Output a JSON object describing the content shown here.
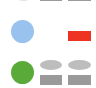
{
  "colors": {
    "background": "#ffffff",
    "blue": "#99c2ee",
    "red": "#ee3322",
    "green": "#5aaa3a",
    "gray_ellipse": "#bdbdbd",
    "gray_rect": "#9a9a9a",
    "faint_top": "#e6e6e6"
  },
  "rows": [
    {
      "name": "top-partial-row",
      "shapes": [
        {
          "type": "circle-partial",
          "color": "faint_top"
        },
        {
          "type": "rect-partial",
          "color": "gray_rect"
        },
        {
          "type": "rect-partial",
          "color": "gray_rect"
        }
      ]
    },
    {
      "name": "blue-row",
      "shapes": [
        {
          "type": "circle",
          "color": "blue"
        },
        {
          "type": "rect",
          "color": "red"
        }
      ]
    },
    {
      "name": "green-row",
      "shapes": [
        {
          "type": "circle",
          "color": "green"
        },
        {
          "type": "ellipse",
          "color": "gray_ellipse"
        },
        {
          "type": "ellipse",
          "color": "gray_ellipse"
        },
        {
          "type": "rect",
          "color": "gray_rect"
        },
        {
          "type": "rect",
          "color": "gray_rect"
        }
      ]
    }
  ]
}
